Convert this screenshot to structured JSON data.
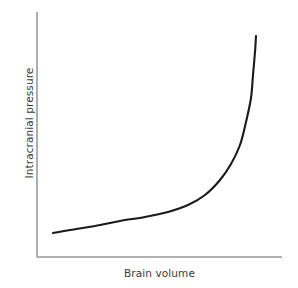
{
  "figure": {
    "background_color": "#ffffff",
    "width": 298,
    "height": 288
  },
  "axes": {
    "y_axis_label": "Intracranial pressure",
    "x_axis_label": "Brain volume",
    "axis_color": "#9a9a9a",
    "curve_color": "#1a1a1a",
    "show_ticks": false,
    "show_gridlines": false,
    "show_tick_labels": false
  },
  "chart_data": {
    "type": "line",
    "title": "",
    "subtitle": "",
    "xlabel": "Brain volume",
    "ylabel": "Intracranial pressure",
    "xlim": [
      0,
      1
    ],
    "ylim": [
      0,
      1
    ],
    "grid": false,
    "legend": null,
    "legend_position": "none",
    "annotations": [],
    "series": [
      {
        "name": "Intracranial pressure vs brain volume",
        "description": "Monotonic exponential-like compliance curve: pressure rises slowly with volume, then climbs steeply past the knee.",
        "x": [
          0.065,
          0.12,
          0.2,
          0.28,
          0.36,
          0.44,
          0.52,
          0.6,
          0.68,
          0.74,
          0.79,
          0.83,
          0.86,
          0.88,
          0.9,
          0.893
        ],
        "y": [
          0.098,
          0.113,
          0.135,
          0.157,
          0.18,
          0.208,
          0.241,
          0.282,
          0.343,
          0.408,
          0.49,
          0.585,
          0.69,
          0.79,
          0.885,
          0.902
        ],
        "path_pixels": [
          [
            53,
            233
          ],
          [
            70,
            230
          ],
          [
            95,
            226
          ],
          [
            120,
            221
          ],
          [
            145,
            217
          ],
          [
            168,
            212
          ],
          [
            188,
            205
          ],
          [
            205,
            195
          ],
          [
            220,
            180
          ],
          [
            231,
            164
          ],
          [
            240,
            145
          ],
          [
            246,
            122
          ],
          [
            251,
            98
          ],
          [
            253,
            75
          ],
          [
            255,
            52
          ],
          [
            256,
            36
          ]
        ]
      }
    ]
  }
}
